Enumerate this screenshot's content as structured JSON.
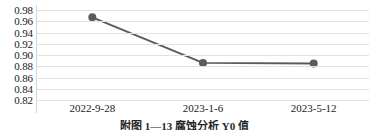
{
  "chart_data": {
    "type": "line",
    "title": "",
    "xlabel": "",
    "ylabel": "",
    "categories": [
      "2022-9-28",
      "2023-1-6",
      "2023-5-12"
    ],
    "values": [
      0.967,
      0.886,
      0.885
    ],
    "series": [
      {
        "name": "series-1",
        "values": [
          0.967,
          0.886,
          0.885
        ],
        "line_color": "#5b5b5b",
        "marker_color": "#5b5b5b",
        "marker": "circle"
      }
    ],
    "ylim": [
      0.82,
      0.98
    ],
    "yticks": [
      "0.98",
      "0.96",
      "0.94",
      "0.92",
      "0.90",
      "0.88",
      "0.86",
      "0.84",
      "0.82"
    ],
    "ytick_values": [
      0.98,
      0.96,
      0.94,
      0.92,
      0.9,
      0.88,
      0.86,
      0.84,
      0.82
    ],
    "grid": true,
    "grid_axis": "y",
    "grid_color": "#e2e2e2",
    "legend": false,
    "legend_position": "none"
  },
  "caption": {
    "text": "附图 1—13  腐蚀分析 Y0 值"
  },
  "colors": {
    "line": "#5b5b5b",
    "marker": "#5b5b5b",
    "grid": "#e2e2e2",
    "axis": "#d4d4d4",
    "text": "#1a1a1a",
    "background": "#ffffff"
  }
}
